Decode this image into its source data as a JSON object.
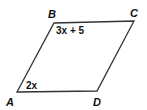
{
  "figure": {
    "shape": "parallelogram",
    "vertices": [
      {
        "name": "A",
        "label": "A"
      },
      {
        "name": "B",
        "label": "B"
      },
      {
        "name": "C",
        "label": "C"
      },
      {
        "name": "D",
        "label": "D"
      }
    ],
    "angles": {
      "B": "3x + 5",
      "A": "2x"
    },
    "stroke_color": "#333333"
  }
}
